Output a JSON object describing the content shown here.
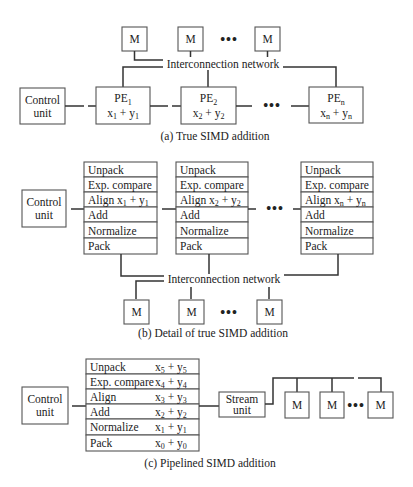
{
  "part_a": {
    "caption": "(a) True SIMD addition",
    "network_label": "Interconnection network",
    "control_unit": [
      "Control",
      "unit"
    ],
    "memories": [
      "M",
      "M",
      "M"
    ],
    "ellipsis": "•••",
    "pes": [
      {
        "name": "PE",
        "sub": "1",
        "x": "x",
        "xs": "1",
        "op": " + ",
        "y": "y",
        "ys": "1"
      },
      {
        "name": "PE",
        "sub": "2",
        "x": "x",
        "xs": "2",
        "op": " + ",
        "y": "y",
        "ys": "2"
      },
      {
        "name": "PE",
        "sub": "n",
        "x": "x",
        "xs": "n",
        "op": " + ",
        "y": "y",
        "ys": "n"
      }
    ]
  },
  "part_b": {
    "caption": "(b) Detail of true SIMD addition",
    "network_label": "Interconnection network",
    "control_unit": [
      "Control",
      "unit"
    ],
    "memories": [
      "M",
      "M",
      "M"
    ],
    "ellipsis": "•••",
    "stages": [
      "Unpack",
      "Exp. compare",
      "Align",
      "Add",
      "Normalize",
      "Pack"
    ],
    "align_subs": [
      "1",
      "2",
      "n"
    ],
    "align_var_x": "x",
    "align_var_y": "y",
    "align_op": " + "
  },
  "part_c": {
    "caption": "(c) Pipelined SIMD addition",
    "control_unit": [
      "Control",
      "unit"
    ],
    "stream_unit": [
      "Stream",
      "unit"
    ],
    "memories": [
      "M",
      "M",
      "M"
    ],
    "ellipsis": "•••",
    "pipeline": [
      {
        "stage": "Unpack",
        "sub": "5"
      },
      {
        "stage": "Exp. compare",
        "sub": "4"
      },
      {
        "stage": "Align",
        "sub": "3"
      },
      {
        "stage": "Add",
        "sub": "2"
      },
      {
        "stage": "Normalize",
        "sub": "1"
      },
      {
        "stage": "Pack",
        "sub": "0"
      }
    ],
    "var_x": "x",
    "var_y": "y",
    "op": " + "
  }
}
